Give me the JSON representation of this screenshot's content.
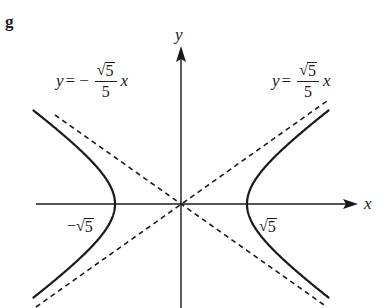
{
  "figure": {
    "panel_label": "g",
    "x_axis_label": "x",
    "y_axis_label": "y",
    "curve": "hyperbola x^2/5 - y^2 = 1",
    "vertex_left_label": "−√5",
    "vertex_right_label": "√5",
    "asymptote_left": {
      "lhs": "y",
      "equals": "=",
      "sign": "−",
      "numerator_radical": "√",
      "numerator_value": "5",
      "denominator": "5",
      "var": "x"
    },
    "asymptote_right": {
      "lhs": "y",
      "equals": "=",
      "numerator_radical": "√",
      "numerator_value": "5",
      "denominator": "5",
      "var": "x"
    },
    "colors": {
      "ink": "#1a1a1a",
      "background": "#ffffff"
    }
  },
  "chart_data": {
    "type": "line",
    "title": "g",
    "xlabel": "x",
    "ylabel": "y",
    "series": [
      {
        "name": "hyperbola right branch",
        "equation": "x^2/5 - y^2 = 1, x > 0",
        "style": "solid",
        "vertex": [
          2.236,
          0
        ]
      },
      {
        "name": "hyperbola left branch",
        "equation": "x^2/5 - y^2 = 1, x < 0",
        "style": "solid",
        "vertex": [
          -2.236,
          0
        ]
      },
      {
        "name": "asymptote positive",
        "equation": "y = (√5/5) x",
        "style": "dashed"
      },
      {
        "name": "asymptote negative",
        "equation": "y = −(√5/5) x",
        "style": "dashed"
      }
    ],
    "annotations": [
      "y = −(√5/5) x",
      "y = (√5/5) x",
      "−√5",
      "√5"
    ],
    "x_ticks": [
      "−√5",
      "√5"
    ],
    "grid": false,
    "legend": "none"
  }
}
